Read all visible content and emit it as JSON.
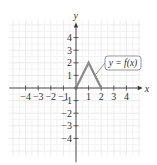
{
  "chart_data": {
    "type": "line",
    "title": "",
    "xlabel": "x",
    "ylabel": "y",
    "xlim": [
      -5,
      5
    ],
    "ylim": [
      -5,
      5
    ],
    "grid": true,
    "x_ticks": [
      -4,
      -3,
      -2,
      -1,
      1,
      2,
      3,
      4
    ],
    "y_ticks": [
      -4,
      -3,
      -2,
      -1,
      1,
      2,
      3,
      4
    ],
    "x_tick_labels": [
      "−4",
      "−3",
      "−2",
      "−1",
      "1",
      "2",
      "3",
      "4"
    ],
    "y_tick_labels": [
      "−4",
      "−3",
      "−2",
      "−1",
      "1",
      "2",
      "3",
      "4"
    ],
    "series": [
      {
        "name": "y = f(x)",
        "x": [
          0,
          1,
          2
        ],
        "y": [
          0,
          2,
          0
        ],
        "color": "#8a8a8a"
      }
    ],
    "annotations": [
      {
        "text": "y = f(x)",
        "points_to": [
          1.5,
          1
        ]
      }
    ]
  }
}
